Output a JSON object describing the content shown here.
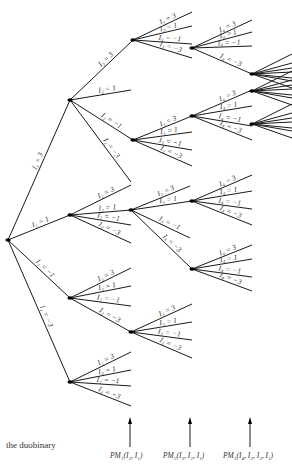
{
  "caption": "the duobinary",
  "bottom_labels": [
    {
      "text": "PM₁(I₂, I₁)",
      "x": 110
    },
    {
      "text": "PM₂(I₃, I₂, I₁)",
      "x": 165
    },
    {
      "text": "PM₃(I₄, I₃, I₂, I₁)",
      "x": 225
    }
  ],
  "arrows_x": [
    130,
    190,
    250
  ],
  "edge_values": [
    "3",
    "1",
    "−1",
    "−3"
  ],
  "tree": {
    "root": {
      "x": 8,
      "y": 240
    },
    "nodes": [
      {
        "id": "a3",
        "x": 70,
        "y": 100,
        "parent": "root",
        "label": "I₁ = 3"
      },
      {
        "id": "a1",
        "x": 70,
        "y": 215,
        "parent": "root",
        "label": "I₁ = 1"
      },
      {
        "id": "am1",
        "x": 70,
        "y": 298,
        "parent": "root",
        "label": "I₁ = −1"
      },
      {
        "id": "am3",
        "x": 70,
        "y": 382,
        "parent": "root",
        "label": "I₁ = −3"
      }
    ]
  }
}
